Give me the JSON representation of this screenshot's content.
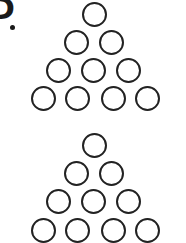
{
  "label": {
    "char": "D",
    "dot": "."
  },
  "ring_color": "#222222",
  "pyramids": [
    {
      "name": "top",
      "rows": [
        1,
        2,
        3,
        4
      ],
      "total": 10
    },
    {
      "name": "bottom",
      "rows": [
        1,
        2,
        3,
        4
      ],
      "total": 10
    }
  ]
}
